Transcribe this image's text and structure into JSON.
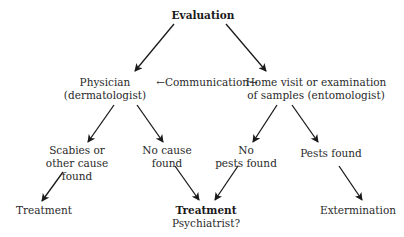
{
  "diagram": {
    "type": "flowchart",
    "nodes": {
      "evaluation": {
        "label": "Evaluation"
      },
      "physician": {
        "line1": "Physician",
        "line2": "(dermatologist)"
      },
      "communication": {
        "label": "←Communication→"
      },
      "home_visit": {
        "line1": "Home visit or examination",
        "line2": "of samples (entomologist)"
      },
      "scabies": {
        "line1": "Scabies or",
        "line2": "other cause",
        "line3": "found"
      },
      "no_cause": {
        "line1": "No cause",
        "line2": "found"
      },
      "no_pests": {
        "line1": "No",
        "line2": "pests found"
      },
      "pests_found": {
        "label": "Pests found"
      },
      "treatment_left": {
        "label": "Treatment"
      },
      "treatment_center": {
        "line1": "Treatment",
        "line2": "Psychiatrist?"
      },
      "extermination": {
        "label": "Extermination"
      }
    },
    "edges": [
      {
        "from": "evaluation",
        "to": "physician"
      },
      {
        "from": "evaluation",
        "to": "home_visit"
      },
      {
        "from": "physician",
        "to": "scabies"
      },
      {
        "from": "physician",
        "to": "no_cause"
      },
      {
        "from": "home_visit",
        "to": "no_pests"
      },
      {
        "from": "home_visit",
        "to": "pests_found"
      },
      {
        "from": "scabies",
        "to": "treatment_left"
      },
      {
        "from": "no_cause",
        "to": "treatment_center"
      },
      {
        "from": "no_pests",
        "to": "treatment_center"
      },
      {
        "from": "pests_found",
        "to": "extermination"
      }
    ],
    "colors": {
      "text": "#2a2a2a",
      "arrow": "#1a1a1a",
      "background": "#ffffff"
    }
  }
}
